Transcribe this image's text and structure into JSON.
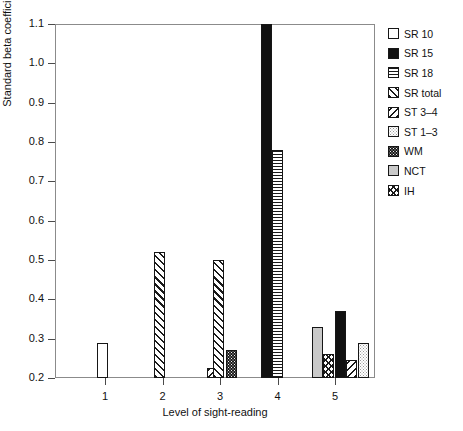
{
  "chart_data": {
    "type": "bar",
    "title": "",
    "xlabel": "Level of sight-reading",
    "ylabel": "Standard beta coefficient",
    "categories": [
      "1",
      "2",
      "3",
      "4",
      "5"
    ],
    "xtick_labels": [
      "1",
      "2",
      "3",
      "4",
      "5"
    ],
    "ytick_labels": [
      "0.2",
      "0.3",
      "0.4",
      "0.5",
      "0.6",
      "0.7",
      "0.8",
      "0.9",
      "1.0",
      "1.1"
    ],
    "ylim": [
      0.2,
      1.1
    ],
    "grid": false,
    "legend_position": "right",
    "series": [
      {
        "name": "SR 10",
        "fill": "f-white",
        "points": [
          {
            "x": "1",
            "y": 0.29
          }
        ]
      },
      {
        "name": "SR 15",
        "fill": "f-black",
        "points": [
          {
            "x": "4",
            "y": 1.1
          },
          {
            "x": "5",
            "y": 0.37
          }
        ]
      },
      {
        "name": "SR 18",
        "fill": "f-horiz",
        "points": [
          {
            "x": "4",
            "y": 0.78
          }
        ]
      },
      {
        "name": "SR total",
        "fill": "f-fslash",
        "points": [
          {
            "x": "2",
            "y": 0.52
          },
          {
            "x": "3",
            "y": 0.5
          }
        ]
      },
      {
        "name": "ST 3–4",
        "fill": "f-bslash",
        "points": [
          {
            "x": "3",
            "y": 0.225
          },
          {
            "x": "5",
            "y": 0.245
          }
        ]
      },
      {
        "name": "ST 1–3",
        "fill": "f-lightdot",
        "points": [
          {
            "x": "5",
            "y": 0.29
          }
        ]
      },
      {
        "name": "WM",
        "fill": "f-darkdot",
        "points": [
          {
            "x": "3",
            "y": 0.27
          }
        ]
      },
      {
        "name": "NCT",
        "fill": "f-gray",
        "points": [
          {
            "x": "5",
            "y": 0.33
          }
        ]
      },
      {
        "name": "IH",
        "fill": "f-cross",
        "points": [
          {
            "x": "5",
            "y": 0.26
          }
        ]
      }
    ],
    "bars": [
      {
        "series": "SR 10",
        "x_px": 102,
        "value": 0.29,
        "fill": "f-white"
      },
      {
        "series": "SR total",
        "x_px": 159.5,
        "value": 0.52,
        "fill": "f-fslash"
      },
      {
        "series": "ST 3–4",
        "x_px": 212,
        "value": 0.225,
        "fill": "f-bslash"
      },
      {
        "series": "SR total",
        "x_px": 218.5,
        "value": 0.5,
        "fill": "f-fslash"
      },
      {
        "series": "WM",
        "x_px": 231,
        "value": 0.27,
        "fill": "f-darkdot"
      },
      {
        "series": "SR 15",
        "x_px": 266,
        "value": 1.1,
        "fill": "f-black"
      },
      {
        "series": "SR 18",
        "x_px": 277.5,
        "value": 0.78,
        "fill": "f-horiz"
      },
      {
        "series": "NCT",
        "x_px": 317,
        "value": 0.33,
        "fill": "f-gray"
      },
      {
        "series": "IH",
        "x_px": 328.5,
        "value": 0.26,
        "fill": "f-cross"
      },
      {
        "series": "SR 15",
        "x_px": 340,
        "value": 0.37,
        "fill": "f-black"
      },
      {
        "series": "ST 3–4",
        "x_px": 351.5,
        "value": 0.245,
        "fill": "f-bslash"
      },
      {
        "series": "ST 1–3",
        "x_px": 363,
        "value": 0.29,
        "fill": "f-lightdot"
      }
    ]
  },
  "legend": {
    "items": [
      {
        "label": "SR 10",
        "fill": "f-white",
        "icon": "legend-swatch-white"
      },
      {
        "label": "SR 15",
        "fill": "f-black",
        "icon": "legend-swatch-solid-black"
      },
      {
        "label": "SR 18",
        "fill": "f-horiz",
        "icon": "legend-swatch-horizontal-lines"
      },
      {
        "label": "SR total",
        "fill": "f-fslash",
        "icon": "legend-swatch-forward-hatch"
      },
      {
        "label": "ST 3–4",
        "fill": "f-bslash",
        "icon": "legend-swatch-back-hatch"
      },
      {
        "label": "ST 1–3",
        "fill": "f-lightdot",
        "icon": "legend-swatch-light-dots"
      },
      {
        "label": "WM",
        "fill": "f-darkdot",
        "icon": "legend-swatch-dark-dots"
      },
      {
        "label": "NCT",
        "fill": "f-gray",
        "icon": "legend-swatch-gray"
      },
      {
        "label": "IH",
        "fill": "f-cross",
        "icon": "legend-swatch-cross-hatch"
      }
    ]
  }
}
